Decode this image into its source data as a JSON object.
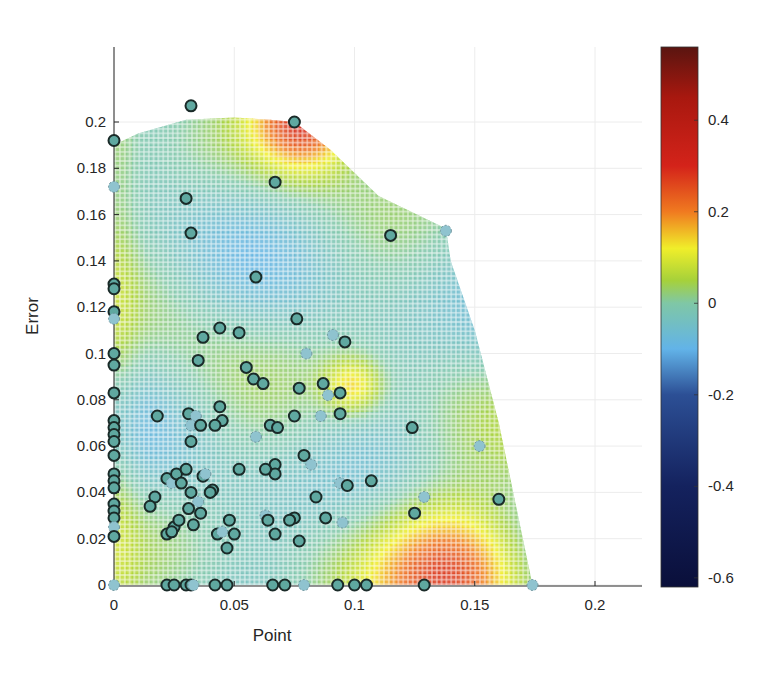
{
  "chart_data": {
    "type": "scatter",
    "subtype": "scatter-over-interpolated-heatmap-with-colorbar",
    "title": "",
    "xlabel": "Point",
    "ylabel": "Error",
    "xlim": [
      0,
      0.22
    ],
    "ylim": [
      0,
      0.22
    ],
    "xticks": [
      0,
      0.05,
      0.1,
      0.15,
      0.2
    ],
    "xtick_labels": [
      "0",
      "0.05",
      "0.1",
      "0.15",
      "0.2"
    ],
    "yticks": [
      0,
      0.02,
      0.04,
      0.06,
      0.08,
      0.1,
      0.12,
      0.14,
      0.16,
      0.18,
      0.2
    ],
    "ytick_labels": [
      "0",
      "0.02",
      "0.04",
      "0.06",
      "0.08",
      "0.1",
      "0.12",
      "0.14",
      "0.16",
      "0.18",
      "0.2"
    ],
    "grid": true,
    "colorbar": {
      "position": "right",
      "range": [
        -0.62,
        0.56
      ],
      "ticks": [
        0.4,
        0.2,
        0,
        -0.2,
        -0.4,
        -0.6
      ],
      "tick_labels": [
        "0.4",
        "0.2",
        "0",
        "-0.2",
        "-0.4",
        "-0.6"
      ],
      "colormap": "jet-like",
      "stops": [
        {
          "v": -0.62,
          "c": "#0a0f3a"
        },
        {
          "v": -0.4,
          "c": "#14225e"
        },
        {
          "v": -0.2,
          "c": "#2c4f95"
        },
        {
          "v": -0.1,
          "c": "#62b3e8"
        },
        {
          "v": 0.0,
          "c": "#7fc7a6"
        },
        {
          "v": 0.05,
          "c": "#a6d13a"
        },
        {
          "v": 0.12,
          "c": "#f0ee2a"
        },
        {
          "v": 0.2,
          "c": "#f07a20"
        },
        {
          "v": 0.3,
          "c": "#d4231a"
        },
        {
          "v": 0.45,
          "c": "#a8180f"
        },
        {
          "v": 0.56,
          "c": "#5a1510"
        }
      ]
    },
    "heatmap": {
      "description": "Interpolated surface on a cell grid (~0.0025 step) bounded by a convex hull of the data; mostly light blue/green (~-0.05 to 0.05) with hot regions near (0.078,0.2) and (0.13-0.15,0.0)",
      "boundary": [
        [
          0,
          0
        ],
        [
          0,
          0.19
        ],
        [
          0.01,
          0.195
        ],
        [
          0.03,
          0.201
        ],
        [
          0.05,
          0.202
        ],
        [
          0.065,
          0.201
        ],
        [
          0.075,
          0.2
        ],
        [
          0.09,
          0.188
        ],
        [
          0.11,
          0.168
        ],
        [
          0.138,
          0.154
        ],
        [
          0.14,
          0.14
        ],
        [
          0.15,
          0.11
        ],
        [
          0.16,
          0.07
        ],
        [
          0.166,
          0.04
        ],
        [
          0.172,
          0.01
        ],
        [
          0.174,
          0
        ]
      ],
      "hotspots": [
        {
          "x": 0.078,
          "y": 0.2,
          "value": 0.3,
          "radius": 0.02
        },
        {
          "x": 0.14,
          "y": 0.005,
          "value": 0.3,
          "radius": 0.03
        },
        {
          "x": 0.098,
          "y": 0.085,
          "value": 0.15,
          "radius": 0.012
        }
      ],
      "base_value": -0.02
    },
    "series": [
      {
        "name": "points",
        "marker": "circle",
        "face_color": "#5fa8a0",
        "edge_color": "#1a2a28",
        "points": [
          [
            0.032,
            0.207
          ],
          [
            0.075,
            0.2
          ],
          [
            0.0,
            0.192
          ],
          [
            0.0,
            0.172
          ],
          [
            0.03,
            0.167
          ],
          [
            0.067,
            0.174
          ],
          [
            0.032,
            0.152
          ],
          [
            0.115,
            0.151
          ],
          [
            0.138,
            0.153
          ],
          [
            0.059,
            0.133
          ],
          [
            0.0,
            0.13
          ],
          [
            0.0,
            0.128
          ],
          [
            0.0,
            0.118
          ],
          [
            0.0,
            0.115
          ],
          [
            0.044,
            0.111
          ],
          [
            0.037,
            0.107
          ],
          [
            0.052,
            0.109
          ],
          [
            0.076,
            0.115
          ],
          [
            0.091,
            0.108
          ],
          [
            0.096,
            0.105
          ],
          [
            0.0,
            0.1
          ],
          [
            0.0,
            0.095
          ],
          [
            0.035,
            0.097
          ],
          [
            0.08,
            0.1
          ],
          [
            0.055,
            0.094
          ],
          [
            0.058,
            0.089
          ],
          [
            0.062,
            0.087
          ],
          [
            0.087,
            0.087
          ],
          [
            0.089,
            0.082
          ],
          [
            0.094,
            0.083
          ],
          [
            0.0,
            0.083
          ],
          [
            0.018,
            0.073
          ],
          [
            0.031,
            0.074
          ],
          [
            0.034,
            0.073
          ],
          [
            0.044,
            0.077
          ],
          [
            0.045,
            0.071
          ],
          [
            0.077,
            0.085
          ],
          [
            0.075,
            0.073
          ],
          [
            0.086,
            0.073
          ],
          [
            0.094,
            0.074
          ],
          [
            0.0,
            0.071
          ],
          [
            0.0,
            0.068
          ],
          [
            0.0,
            0.065
          ],
          [
            0.032,
            0.069
          ],
          [
            0.036,
            0.069
          ],
          [
            0.042,
            0.069
          ],
          [
            0.065,
            0.069
          ],
          [
            0.068,
            0.068
          ],
          [
            0.059,
            0.064
          ],
          [
            0.124,
            0.068
          ],
          [
            0.032,
            0.062
          ],
          [
            0.0,
            0.062
          ],
          [
            0.0,
            0.056
          ],
          [
            0.152,
            0.06
          ],
          [
            0.052,
            0.05
          ],
          [
            0.067,
            0.052
          ],
          [
            0.079,
            0.056
          ],
          [
            0.067,
            0.048
          ],
          [
            0.082,
            0.052
          ],
          [
            0.0,
            0.048
          ],
          [
            0.0,
            0.045
          ],
          [
            0.0,
            0.042
          ],
          [
            0.022,
            0.046
          ],
          [
            0.024,
            0.044
          ],
          [
            0.026,
            0.048
          ],
          [
            0.028,
            0.044
          ],
          [
            0.03,
            0.05
          ],
          [
            0.037,
            0.047
          ],
          [
            0.038,
            0.048
          ],
          [
            0.063,
            0.05
          ],
          [
            0.041,
            0.041
          ],
          [
            0.032,
            0.04
          ],
          [
            0.04,
            0.04
          ],
          [
            0.094,
            0.044
          ],
          [
            0.097,
            0.043
          ],
          [
            0.107,
            0.045
          ],
          [
            0.017,
            0.038
          ],
          [
            0.015,
            0.034
          ],
          [
            0.035,
            0.036
          ],
          [
            0.031,
            0.033
          ],
          [
            0.036,
            0.031
          ],
          [
            0.084,
            0.038
          ],
          [
            0.16,
            0.037
          ],
          [
            0.129,
            0.038
          ],
          [
            0.0,
            0.035
          ],
          [
            0.0,
            0.032
          ],
          [
            0.0,
            0.029
          ],
          [
            0.048,
            0.028
          ],
          [
            0.063,
            0.03
          ],
          [
            0.064,
            0.028
          ],
          [
            0.075,
            0.029
          ],
          [
            0.073,
            0.028
          ],
          [
            0.088,
            0.029
          ],
          [
            0.095,
            0.027
          ],
          [
            0.125,
            0.031
          ],
          [
            0.025,
            0.025
          ],
          [
            0.027,
            0.028
          ],
          [
            0.033,
            0.026
          ],
          [
            0.0,
            0.025
          ],
          [
            0.0,
            0.021
          ],
          [
            0.022,
            0.022
          ],
          [
            0.024,
            0.023
          ],
          [
            0.043,
            0.022
          ],
          [
            0.045,
            0.023
          ],
          [
            0.05,
            0.022
          ],
          [
            0.067,
            0.022
          ],
          [
            0.077,
            0.019
          ],
          [
            0.047,
            0.016
          ],
          [
            0.0,
            0.0
          ],
          [
            0.022,
            0.0
          ],
          [
            0.025,
            0.0
          ],
          [
            0.03,
            0.0
          ],
          [
            0.032,
            0.0
          ],
          [
            0.033,
            0.0
          ],
          [
            0.042,
            0.0
          ],
          [
            0.047,
            0.0
          ],
          [
            0.066,
            0.0
          ],
          [
            0.071,
            0.0
          ],
          [
            0.079,
            0.0
          ],
          [
            0.093,
            0.0
          ],
          [
            0.1,
            0.0
          ],
          [
            0.105,
            0.0
          ],
          [
            0.129,
            0.0
          ],
          [
            0.174,
            0.0
          ]
        ]
      }
    ]
  }
}
